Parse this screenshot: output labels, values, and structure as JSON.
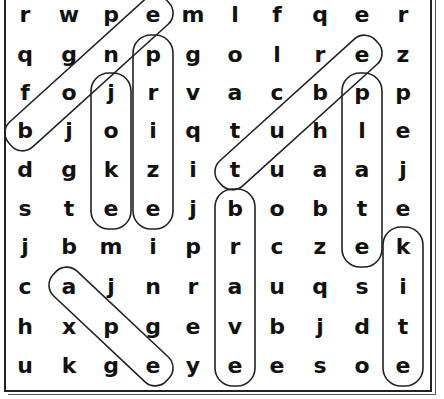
{
  "puzzle": {
    "grid": [
      [
        "r",
        "w",
        "p",
        "e",
        "m",
        "l",
        "f",
        "q",
        "e",
        "r"
      ],
      [
        "q",
        "g",
        "n",
        "p",
        "g",
        "o",
        "l",
        "r",
        "e",
        "z"
      ],
      [
        "f",
        "o",
        "j",
        "r",
        "v",
        "a",
        "c",
        "b",
        "p",
        "p"
      ],
      [
        "b",
        "j",
        "o",
        "i",
        "q",
        "t",
        "u",
        "h",
        "l",
        "e"
      ],
      [
        "d",
        "g",
        "k",
        "z",
        "i",
        "t",
        "u",
        "a",
        "a",
        "j"
      ],
      [
        "s",
        "t",
        "e",
        "e",
        "j",
        "b",
        "o",
        "b",
        "t",
        "e"
      ],
      [
        "j",
        "b",
        "m",
        "i",
        "p",
        "r",
        "c",
        "z",
        "e",
        "k"
      ],
      [
        "c",
        "a",
        "j",
        "n",
        "r",
        "a",
        "u",
        "q",
        "s",
        "i"
      ],
      [
        "h",
        "x",
        "p",
        "g",
        "e",
        "v",
        "b",
        "j",
        "d",
        "t"
      ],
      [
        "u",
        "k",
        "g",
        "e",
        "y",
        "e",
        "e",
        "s",
        "o",
        "e"
      ]
    ],
    "found_words": [
      {
        "word": "bone",
        "from": [
          3,
          0
        ],
        "to": [
          0,
          3
        ]
      },
      {
        "word": "joke",
        "from": [
          2,
          2
        ],
        "to": [
          5,
          2
        ]
      },
      {
        "word": "prize",
        "from": [
          1,
          3
        ],
        "to": [
          5,
          3
        ]
      },
      {
        "word": "tube",
        "from": [
          4,
          5
        ],
        "to": [
          1,
          8
        ]
      },
      {
        "word": "plate",
        "from": [
          2,
          8
        ],
        "to": [
          6,
          8
        ]
      },
      {
        "word": "brave",
        "from": [
          5,
          5
        ],
        "to": [
          9,
          5
        ]
      },
      {
        "word": "kite",
        "from": [
          6,
          9
        ],
        "to": [
          9,
          9
        ]
      },
      {
        "word": "ape",
        "from": [
          7,
          1
        ],
        "to": [
          9,
          3
        ]
      }
    ],
    "colors": {
      "ink": "#111111",
      "ring": "#222222",
      "background": "#ffffff"
    }
  }
}
